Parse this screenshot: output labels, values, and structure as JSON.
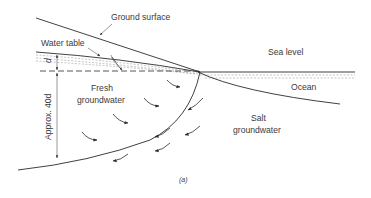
{
  "figure": {
    "caption": "(a)",
    "labels": {
      "ground_surface": "Ground surface",
      "water_table": "Water table",
      "sea_level": "Sea level",
      "ocean": "Ocean",
      "fresh_line1": "Fresh",
      "fresh_line2": "groundwater",
      "salt_line1": "Salt",
      "salt_line2": "groundwater",
      "d": "d",
      "depth": "Approx. 40d"
    }
  }
}
